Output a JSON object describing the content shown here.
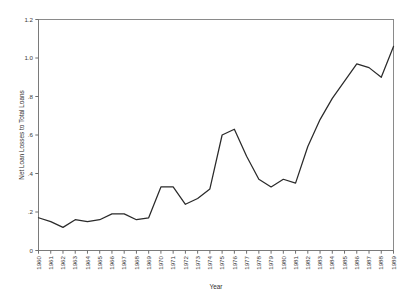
{
  "chart_data": {
    "type": "line",
    "title": "",
    "xlabel": "Year",
    "ylabel": "Net Loan Losses to Total Loans",
    "x": [
      1960,
      1961,
      1962,
      1963,
      1964,
      1965,
      1966,
      1967,
      1968,
      1969,
      1970,
      1971,
      1972,
      1973,
      1974,
      1975,
      1976,
      1977,
      1978,
      1979,
      1980,
      1981,
      1982,
      1983,
      1984,
      1985,
      1986,
      1987,
      1988,
      1989
    ],
    "values": [
      0.17,
      0.15,
      0.12,
      0.16,
      0.15,
      0.16,
      0.19,
      0.19,
      0.16,
      0.17,
      0.33,
      0.33,
      0.24,
      0.27,
      0.32,
      0.6,
      0.63,
      0.49,
      0.37,
      0.33,
      0.37,
      0.35,
      0.54,
      0.68,
      0.79,
      0.88,
      0.97,
      0.95,
      0.9,
      1.06
    ],
    "xtick_labels": [
      "1960",
      "1961",
      "1962",
      "1963",
      "1964",
      "1965",
      "1966",
      "1967",
      "1968",
      "1969",
      "1970",
      "1971",
      "1972",
      "1973",
      "1974",
      "1975",
      "1976",
      "1977",
      "1978",
      "1979",
      "1980",
      "1981",
      "1982",
      "1983",
      "1984",
      "1985",
      "1986",
      "1987",
      "1988",
      "1989"
    ],
    "ytick_labels": [
      "0",
      ".2",
      ".4",
      ".6",
      ".8",
      "1.0",
      "1.2"
    ],
    "ytick_values": [
      0,
      0.2,
      0.4,
      0.6,
      0.8,
      1.0,
      1.2
    ],
    "ylim": [
      0,
      1.2
    ],
    "xlim": [
      1960,
      1989
    ],
    "grid": false,
    "legend": false,
    "series_color": "#2a2a2a"
  }
}
